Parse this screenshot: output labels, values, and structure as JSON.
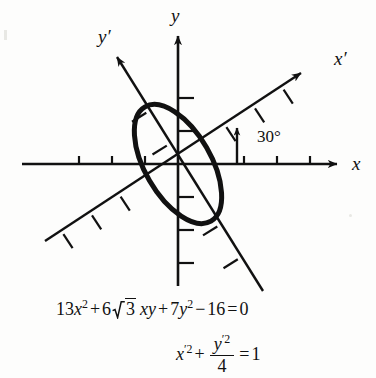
{
  "figure": {
    "background_color": "#fdfdfc",
    "ink_color": "#111111",
    "rotation_angle_degrees": 30,
    "angle_label": "30°",
    "axes": {
      "x_label": "x",
      "y_label": "y",
      "x_prime_label": "x′",
      "y_prime_label": "y′"
    },
    "ticks": {
      "x_axis_negative_count": 3,
      "x_axis_positive_count": 3,
      "y_axis_positive_count": 2,
      "y_axis_negative_count": 3,
      "x_prime_positive_count": 3,
      "x_prime_negative_count": 3,
      "y_prime_positive_count": 2,
      "y_prime_negative_count": 2,
      "spacing_px": 33
    },
    "ellipse": {
      "center": [
        178,
        164
      ],
      "semi_major_px": 66,
      "semi_minor_px": 33,
      "major_axis_direction_degrees": 120,
      "stroke_width_px": 5
    }
  },
  "equations": {
    "general": {
      "coefficient_x2": "13",
      "var_x": "x",
      "exponent_2": "2",
      "plus": "+",
      "coefficient_xy": "6",
      "radicand": "3",
      "var_xy": "xy",
      "coefficient_y2": "7",
      "var_y": "y",
      "minus": "−",
      "constant": "16",
      "equals": "=",
      "rhs": "0",
      "plain": "13x² + 6√3 xy + 7y² − 16 = 0"
    },
    "rotated": {
      "term_x": "x",
      "prime": "′",
      "exponent_2": "2",
      "plus": "+",
      "numerator_var": "y",
      "denominator": "4",
      "equals": "=",
      "rhs": "1",
      "plain": "x′² + y′²/4 = 1"
    }
  }
}
